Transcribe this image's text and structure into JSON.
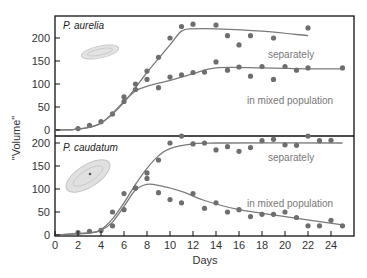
{
  "chart_data": [
    {
      "type": "scatter",
      "title": "P. aurelia",
      "xlabel": "Days",
      "ylabel": "\"Volume\"",
      "xlim": [
        0,
        26
      ],
      "ylim": [
        0,
        240
      ],
      "yticks": [
        0,
        50,
        100,
        150,
        200
      ],
      "series": [
        {
          "name": "separately",
          "points": [
            [
              2,
              3
            ],
            [
              3,
              10
            ],
            [
              4,
              18
            ],
            [
              5,
              35
            ],
            [
              6,
              72
            ],
            [
              7,
              100
            ],
            [
              8,
              128
            ],
            [
              9,
              158
            ],
            [
              10,
              200
            ],
            [
              11,
              225
            ],
            [
              12,
              230
            ],
            [
              14,
              228
            ],
            [
              15,
              205
            ],
            [
              16,
              185
            ],
            [
              17,
              205
            ],
            [
              19,
              200
            ],
            [
              22,
              222
            ]
          ],
          "fit": [
            [
              0,
              0
            ],
            [
              2,
              2
            ],
            [
              4,
              15
            ],
            [
              6,
              60
            ],
            [
              8,
              125
            ],
            [
              10,
              185
            ],
            [
              11,
              215
            ],
            [
              12,
              220
            ],
            [
              14,
              220
            ],
            [
              18,
              215
            ],
            [
              22,
              205
            ]
          ]
        },
        {
          "name": "in mixed population",
          "points": [
            [
              6,
              62
            ],
            [
              7,
              88
            ],
            [
              8,
              110
            ],
            [
              9,
              92
            ],
            [
              10,
              115
            ],
            [
              11,
              120
            ],
            [
              12,
              125
            ],
            [
              13,
              126
            ],
            [
              14,
              148
            ],
            [
              15,
              130
            ],
            [
              16,
              137
            ],
            [
              17,
              117
            ],
            [
              18,
              138
            ],
            [
              19,
              110
            ],
            [
              20,
              138
            ],
            [
              21,
              130
            ],
            [
              22,
              135
            ],
            [
              25,
              135
            ]
          ],
          "fit": [
            [
              0,
              0
            ],
            [
              2,
              2
            ],
            [
              4,
              15
            ],
            [
              6,
              62
            ],
            [
              7,
              85
            ],
            [
              8,
              95
            ],
            [
              10,
              108
            ],
            [
              12,
              122
            ],
            [
              14,
              135
            ],
            [
              18,
              135
            ],
            [
              22,
              133
            ],
            [
              25,
              133
            ]
          ]
        }
      ]
    },
    {
      "type": "scatter",
      "title": "P. caudatum",
      "xlabel": "Days",
      "ylabel": "\"Volume\"",
      "xlim": [
        0,
        26
      ],
      "ylim": [
        0,
        240
      ],
      "xticks": [
        0,
        2,
        4,
        6,
        8,
        10,
        12,
        14,
        16,
        18,
        20,
        22,
        24
      ],
      "yticks": [
        0,
        50,
        100,
        150,
        200
      ],
      "series": [
        {
          "name": "separately",
          "points": [
            [
              2,
              5
            ],
            [
              3,
              8
            ],
            [
              4,
              10
            ],
            [
              5,
              50
            ],
            [
              6,
              90
            ],
            [
              7,
              102
            ],
            [
              8,
              135
            ],
            [
              9,
              163
            ],
            [
              10,
              200
            ],
            [
              11,
              215
            ],
            [
              12,
              198
            ],
            [
              13,
              200
            ],
            [
              14,
              185
            ],
            [
              15,
              192
            ],
            [
              16,
              182
            ],
            [
              17,
              190
            ],
            [
              18,
              205
            ],
            [
              19,
              208
            ],
            [
              20,
              196
            ],
            [
              21,
              195
            ],
            [
              22,
              215
            ],
            [
              23,
              205
            ],
            [
              24,
              206
            ]
          ],
          "fit": [
            [
              0,
              0
            ],
            [
              3,
              5
            ],
            [
              4,
              12
            ],
            [
              5,
              35
            ],
            [
              6,
              70
            ],
            [
              7,
              110
            ],
            [
              8,
              145
            ],
            [
              9,
              172
            ],
            [
              10,
              188
            ],
            [
              12,
              198
            ],
            [
              14,
              200
            ],
            [
              25,
              200
            ]
          ]
        },
        {
          "name": "in mixed population",
          "points": [
            [
              5,
              20
            ],
            [
              6,
              55
            ],
            [
              7,
              102
            ],
            [
              8,
              123
            ],
            [
              9,
              92
            ],
            [
              10,
              77
            ],
            [
              11,
              70
            ],
            [
              12,
              90
            ],
            [
              13,
              58
            ],
            [
              14,
              70
            ],
            [
              15,
              50
            ],
            [
              16,
              55
            ],
            [
              17,
              40
            ],
            [
              18,
              45
            ],
            [
              19,
              45
            ],
            [
              20,
              50
            ],
            [
              21,
              38
            ],
            [
              22,
              20
            ],
            [
              23,
              20
            ],
            [
              24,
              32
            ],
            [
              25,
              20
            ]
          ],
          "fit": [
            [
              0,
              0
            ],
            [
              3,
              4
            ],
            [
              4,
              10
            ],
            [
              5,
              28
            ],
            [
              6,
              62
            ],
            [
              7,
              98
            ],
            [
              8,
              110
            ],
            [
              9,
              108
            ],
            [
              11,
              95
            ],
            [
              13,
              75
            ],
            [
              16,
              55
            ],
            [
              20,
              40
            ],
            [
              25,
              22
            ]
          ]
        }
      ]
    }
  ],
  "panels": {
    "top": {
      "title": "P. aurelia",
      "label_separately": "separately",
      "label_mixed": "in mixed population"
    },
    "bottom": {
      "title": "P. caudatum",
      "label_separately": "separately",
      "label_mixed": "in mixed population"
    }
  },
  "axes": {
    "ylabel": "\"Volume\"",
    "xlabel": "Days",
    "yticks": [
      "0",
      "50",
      "100",
      "150",
      "200"
    ],
    "xticks": [
      "0",
      "2",
      "4",
      "6",
      "8",
      "10",
      "12",
      "14",
      "16",
      "18",
      "20",
      "22",
      "24"
    ]
  },
  "colors": {
    "line": "#7a7a7a",
    "dot": "#6e6e6e",
    "frame": "#111111",
    "label": "#777777"
  }
}
